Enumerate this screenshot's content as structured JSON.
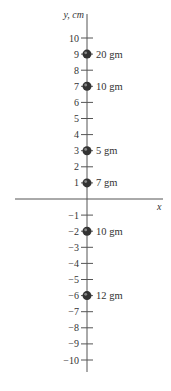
{
  "axes": {
    "y_label": "y, cm",
    "x_label": "x",
    "y_ticks": [
      10,
      9,
      8,
      7,
      6,
      5,
      4,
      3,
      2,
      1,
      -1,
      -2,
      -3,
      -4,
      -5,
      -6,
      -7,
      -8,
      -9,
      -10
    ],
    "origin_px": {
      "x": 87,
      "y": 199
    },
    "tick_spacing_px": 16.1
  },
  "masses": [
    {
      "y": 9,
      "label": "20 gm"
    },
    {
      "y": 7,
      "label": "10 gm"
    },
    {
      "y": 3,
      "label": "5 gm"
    },
    {
      "y": 1,
      "label": "7 gm"
    },
    {
      "y": -2,
      "label": "10 gm"
    },
    {
      "y": -6,
      "label": "12 gm"
    }
  ],
  "colors": {
    "axis": "#555555",
    "mass": "#333333",
    "text": "#333333"
  }
}
